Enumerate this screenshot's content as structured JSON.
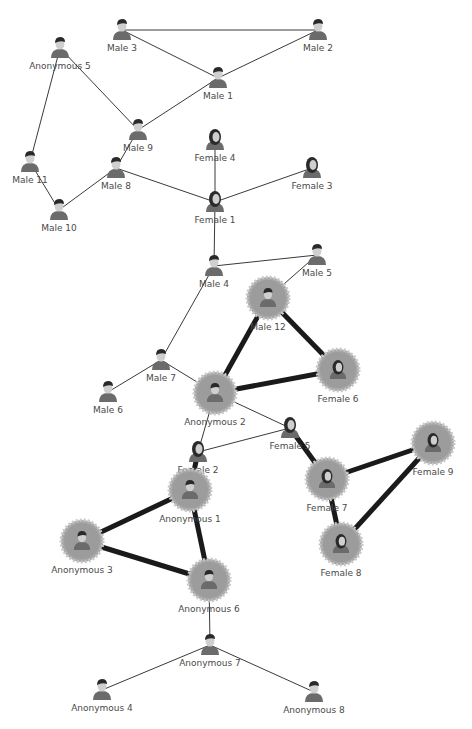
{
  "graph": {
    "nodes": [
      {
        "id": "male3",
        "label": "Male 3",
        "x": 122,
        "y": 30,
        "gender": "male",
        "highlighted": false
      },
      {
        "id": "male2",
        "label": "Male 2",
        "x": 318,
        "y": 30,
        "gender": "male",
        "highlighted": false
      },
      {
        "id": "anon5",
        "label": "Anonymous 5",
        "x": 60,
        "y": 48,
        "gender": "male",
        "highlighted": false
      },
      {
        "id": "male1",
        "label": "Male 1",
        "x": 218,
        "y": 78,
        "gender": "male",
        "highlighted": false
      },
      {
        "id": "male9",
        "label": "Male 9",
        "x": 138,
        "y": 130,
        "gender": "male",
        "highlighted": false
      },
      {
        "id": "female4",
        "label": "Female 4",
        "x": 215,
        "y": 140,
        "gender": "female",
        "highlighted": false
      },
      {
        "id": "female3",
        "label": "Female 3",
        "x": 312,
        "y": 168,
        "gender": "female",
        "highlighted": false
      },
      {
        "id": "male11",
        "label": "Male 11",
        "x": 30,
        "y": 162,
        "gender": "male",
        "highlighted": false
      },
      {
        "id": "male8",
        "label": "Male 8",
        "x": 116,
        "y": 168,
        "gender": "male",
        "highlighted": false
      },
      {
        "id": "female1",
        "label": "Female 1",
        "x": 215,
        "y": 202,
        "gender": "female",
        "highlighted": false
      },
      {
        "id": "male10",
        "label": "Male 10",
        "x": 59,
        "y": 210,
        "gender": "male",
        "highlighted": false
      },
      {
        "id": "male4",
        "label": "Male 4",
        "x": 214,
        "y": 266,
        "gender": "male",
        "highlighted": false
      },
      {
        "id": "male5",
        "label": "Male 5",
        "x": 317,
        "y": 255,
        "gender": "male",
        "highlighted": false
      },
      {
        "id": "male12",
        "label": "Male 12",
        "x": 268,
        "y": 298,
        "gender": "male",
        "highlighted": true
      },
      {
        "id": "male7",
        "label": "Male 7",
        "x": 161,
        "y": 360,
        "gender": "male",
        "highlighted": false
      },
      {
        "id": "male6",
        "label": "Male 6",
        "x": 108,
        "y": 392,
        "gender": "male",
        "highlighted": false
      },
      {
        "id": "anon2",
        "label": "Anonymous 2",
        "x": 215,
        "y": 393,
        "gender": "male",
        "highlighted": true
      },
      {
        "id": "female6",
        "label": "Female 6",
        "x": 338,
        "y": 370,
        "gender": "female",
        "highlighted": true
      },
      {
        "id": "female5",
        "label": "Female 5",
        "x": 290,
        "y": 428,
        "gender": "female",
        "highlighted": false
      },
      {
        "id": "female2",
        "label": "Female 2",
        "x": 198,
        "y": 452,
        "gender": "female",
        "highlighted": false
      },
      {
        "id": "female9",
        "label": "Female 9",
        "x": 433,
        "y": 443,
        "gender": "female",
        "highlighted": true
      },
      {
        "id": "female7",
        "label": "Female 7",
        "x": 327,
        "y": 479,
        "gender": "female",
        "highlighted": true
      },
      {
        "id": "anon1",
        "label": "Anonymous 1",
        "x": 190,
        "y": 490,
        "gender": "male",
        "highlighted": true
      },
      {
        "id": "anon3",
        "label": "Anonymous 3",
        "x": 82,
        "y": 541,
        "gender": "male",
        "highlighted": true
      },
      {
        "id": "female8",
        "label": "Female 8",
        "x": 341,
        "y": 544,
        "gender": "female",
        "highlighted": true
      },
      {
        "id": "anon6",
        "label": "Anonymous 6",
        "x": 209,
        "y": 580,
        "gender": "male",
        "highlighted": true
      },
      {
        "id": "anon7",
        "label": "Anonymous 7",
        "x": 210,
        "y": 645,
        "gender": "male",
        "highlighted": false
      },
      {
        "id": "anon4",
        "label": "Anonymous 4",
        "x": 102,
        "y": 690,
        "gender": "male",
        "highlighted": false
      },
      {
        "id": "anon8",
        "label": "Anonymous 8",
        "x": 314,
        "y": 692,
        "gender": "male",
        "highlighted": false
      }
    ],
    "edges": [
      {
        "from": "male3",
        "to": "male2",
        "strong": false
      },
      {
        "from": "male3",
        "to": "male1",
        "strong": false
      },
      {
        "from": "male2",
        "to": "male1",
        "strong": false
      },
      {
        "from": "male1",
        "to": "male9",
        "strong": false
      },
      {
        "from": "anon5",
        "to": "male9",
        "strong": false
      },
      {
        "from": "anon5",
        "to": "male11",
        "strong": false
      },
      {
        "from": "male11",
        "to": "male10",
        "strong": false
      },
      {
        "from": "male10",
        "to": "male8",
        "strong": false
      },
      {
        "from": "male8",
        "to": "male9",
        "strong": false
      },
      {
        "from": "male8",
        "to": "female1",
        "strong": false
      },
      {
        "from": "female4",
        "to": "female1",
        "strong": false
      },
      {
        "from": "female3",
        "to": "female1",
        "strong": false
      },
      {
        "from": "female1",
        "to": "male4",
        "strong": false
      },
      {
        "from": "male4",
        "to": "male5",
        "strong": false
      },
      {
        "from": "male5",
        "to": "male12",
        "strong": false
      },
      {
        "from": "male4",
        "to": "male7",
        "strong": false
      },
      {
        "from": "male7",
        "to": "male6",
        "strong": false
      },
      {
        "from": "male7",
        "to": "anon2",
        "strong": false
      },
      {
        "from": "male12",
        "to": "anon2",
        "strong": true
      },
      {
        "from": "male12",
        "to": "female6",
        "strong": true
      },
      {
        "from": "anon2",
        "to": "female6",
        "strong": true
      },
      {
        "from": "anon2",
        "to": "female5",
        "strong": false
      },
      {
        "from": "anon2",
        "to": "female2",
        "strong": false
      },
      {
        "from": "female2",
        "to": "female5",
        "strong": false
      },
      {
        "from": "female5",
        "to": "female7",
        "strong": true
      },
      {
        "from": "female7",
        "to": "female9",
        "strong": true
      },
      {
        "from": "female7",
        "to": "female8",
        "strong": true
      },
      {
        "from": "female9",
        "to": "female8",
        "strong": true
      },
      {
        "from": "female2",
        "to": "anon1",
        "strong": true
      },
      {
        "from": "anon1",
        "to": "anon3",
        "strong": true
      },
      {
        "from": "anon1",
        "to": "anon6",
        "strong": true
      },
      {
        "from": "anon3",
        "to": "anon6",
        "strong": true
      },
      {
        "from": "anon6",
        "to": "anon7",
        "strong": false
      },
      {
        "from": "anon7",
        "to": "anon4",
        "strong": false
      },
      {
        "from": "anon7",
        "to": "anon8",
        "strong": false
      }
    ]
  }
}
